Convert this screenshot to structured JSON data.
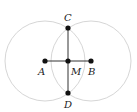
{
  "diagram": {
    "type": "perpendicular-bisector-construction",
    "colors": {
      "circle": "#d6d6d6",
      "line": "#333333",
      "point": "#111111"
    },
    "points": [
      {
        "id": "A",
        "label": "A",
        "x": 45,
        "y": 61,
        "lx": 37,
        "ly": 75
      },
      {
        "id": "M",
        "label": "M",
        "x": 68,
        "y": 61,
        "lx": 71,
        "ly": 75
      },
      {
        "id": "B",
        "label": "B",
        "x": 91,
        "y": 61,
        "lx": 88,
        "ly": 75
      },
      {
        "id": "C",
        "label": "C",
        "x": 68,
        "y": 28,
        "lx": 64,
        "ly": 21
      },
      {
        "id": "D",
        "label": "D",
        "x": 68,
        "y": 93,
        "lx": 64,
        "ly": 107
      }
    ],
    "circles": [
      {
        "center": "A",
        "cx": 45,
        "cy": 61,
        "r": 40
      },
      {
        "center": "B",
        "cx": 91,
        "cy": 61,
        "r": 40
      }
    ],
    "segments": [
      {
        "from": "A",
        "to": "B"
      },
      {
        "from": "C",
        "to": "D"
      }
    ]
  }
}
